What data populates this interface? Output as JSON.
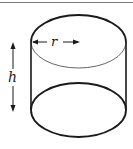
{
  "diagram": {
    "type": "cylinder",
    "labels": {
      "radius": "r",
      "height": "h"
    },
    "colors": {
      "stroke": "#1a1a1a",
      "top_rule": "#777777",
      "background": "#ffffff"
    }
  }
}
